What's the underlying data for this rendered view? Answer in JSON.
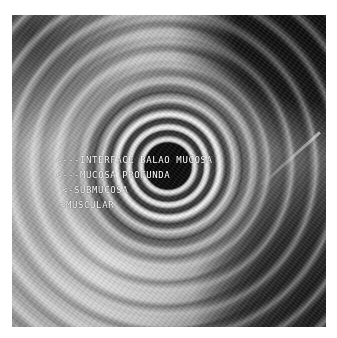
{
  "figure": {
    "type": "endoscopic ultrasound image",
    "annotations": [
      {
        "arrow": "<---",
        "text": "INTERFACE BALAO MUCOSA"
      },
      {
        "arrow": "<---",
        "text": "MUCOSA PROFUNDA"
      },
      {
        "arrow": "<-",
        "text": "SUBMUCOSA"
      },
      {
        "arrow": "<",
        "text": "MUSCULAR"
      }
    ]
  }
}
